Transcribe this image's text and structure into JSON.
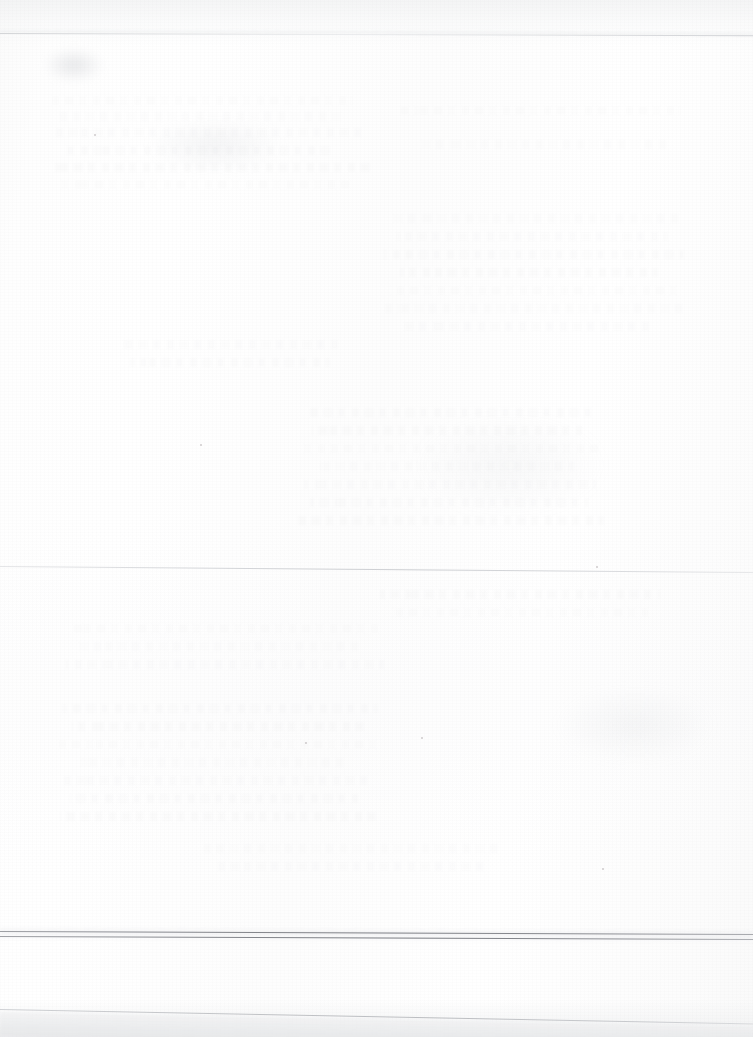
{
  "document": {
    "kind": "scanned-page",
    "page_state": "blank",
    "visible_text": "",
    "description_label": "Blank scanned page"
  },
  "canvas": {
    "width": 753,
    "height": 1037
  },
  "colors": {
    "paper": "#fdfdfd",
    "paper_edge_tint": "#f2f3f4",
    "artifact_line_dark": "#7c7e84",
    "artifact_line_light": "#cdcfd2",
    "ghost_text": "#787a80",
    "footer_band": "#e9eaec"
  },
  "artifacts": {
    "top_line": {
      "name": "top-scan-line",
      "y": 33,
      "tone": "#cdcfd2"
    },
    "mid_line": {
      "name": "middle-scan-line",
      "y": 566,
      "tone": "#c8cace"
    },
    "bottom_line_upper": {
      "name": "bottom-scan-line-upper",
      "y": 931,
      "tone": "#7c7e84"
    },
    "bottom_line_lower": {
      "name": "bottom-scan-line-lower",
      "y": 936,
      "tone": "#787a80"
    },
    "footer_line": {
      "name": "footer-scan-line",
      "y": 1009,
      "tone": "#b6b8bc"
    }
  },
  "ghost_bands": [
    {
      "top": 96,
      "left": 52,
      "width": 300
    },
    {
      "top": 112,
      "left": 60,
      "width": 286
    },
    {
      "top": 128,
      "left": 55,
      "width": 312
    },
    {
      "top": 146,
      "left": 64,
      "width": 268
    },
    {
      "top": 163,
      "left": 50,
      "width": 320
    },
    {
      "top": 180,
      "left": 58,
      "width": 294
    },
    {
      "top": 214,
      "left": 388,
      "width": 290
    },
    {
      "top": 232,
      "left": 396,
      "width": 272
    },
    {
      "top": 250,
      "left": 384,
      "width": 300
    },
    {
      "top": 268,
      "left": 400,
      "width": 258
    },
    {
      "top": 286,
      "left": 390,
      "width": 286
    },
    {
      "top": 304,
      "left": 382,
      "width": 304
    },
    {
      "top": 322,
      "left": 404,
      "width": 250
    },
    {
      "top": 408,
      "left": 306,
      "width": 288
    },
    {
      "top": 426,
      "left": 312,
      "width": 270
    },
    {
      "top": 444,
      "left": 300,
      "width": 300
    },
    {
      "top": 462,
      "left": 320,
      "width": 254
    },
    {
      "top": 480,
      "left": 304,
      "width": 292
    },
    {
      "top": 498,
      "left": 310,
      "width": 278
    },
    {
      "top": 516,
      "left": 298,
      "width": 306
    },
    {
      "top": 624,
      "left": 70,
      "width": 310
    },
    {
      "top": 642,
      "left": 78,
      "width": 284
    },
    {
      "top": 660,
      "left": 66,
      "width": 318
    },
    {
      "top": 704,
      "left": 62,
      "width": 316
    },
    {
      "top": 722,
      "left": 72,
      "width": 292
    },
    {
      "top": 740,
      "left": 58,
      "width": 324
    },
    {
      "top": 758,
      "left": 80,
      "width": 268
    },
    {
      "top": 776,
      "left": 64,
      "width": 310
    },
    {
      "top": 794,
      "left": 70,
      "width": 288
    },
    {
      "top": 812,
      "left": 60,
      "width": 316
    },
    {
      "top": 106,
      "left": 400,
      "width": 280
    },
    {
      "top": 140,
      "left": 420,
      "width": 250
    },
    {
      "top": 340,
      "left": 120,
      "width": 220
    },
    {
      "top": 358,
      "left": 130,
      "width": 200
    },
    {
      "top": 590,
      "left": 380,
      "width": 280
    },
    {
      "top": 608,
      "left": 392,
      "width": 256
    },
    {
      "top": 844,
      "left": 200,
      "width": 300
    },
    {
      "top": 862,
      "left": 214,
      "width": 272
    }
  ],
  "specks": [
    {
      "left": 305,
      "top": 742,
      "size": 2
    },
    {
      "left": 421,
      "top": 737,
      "size": 2
    },
    {
      "left": 596,
      "top": 566,
      "size": 2
    },
    {
      "left": 200,
      "top": 444,
      "size": 2
    },
    {
      "left": 602,
      "top": 868,
      "size": 2
    },
    {
      "left": 94,
      "top": 134,
      "size": 2
    }
  ]
}
